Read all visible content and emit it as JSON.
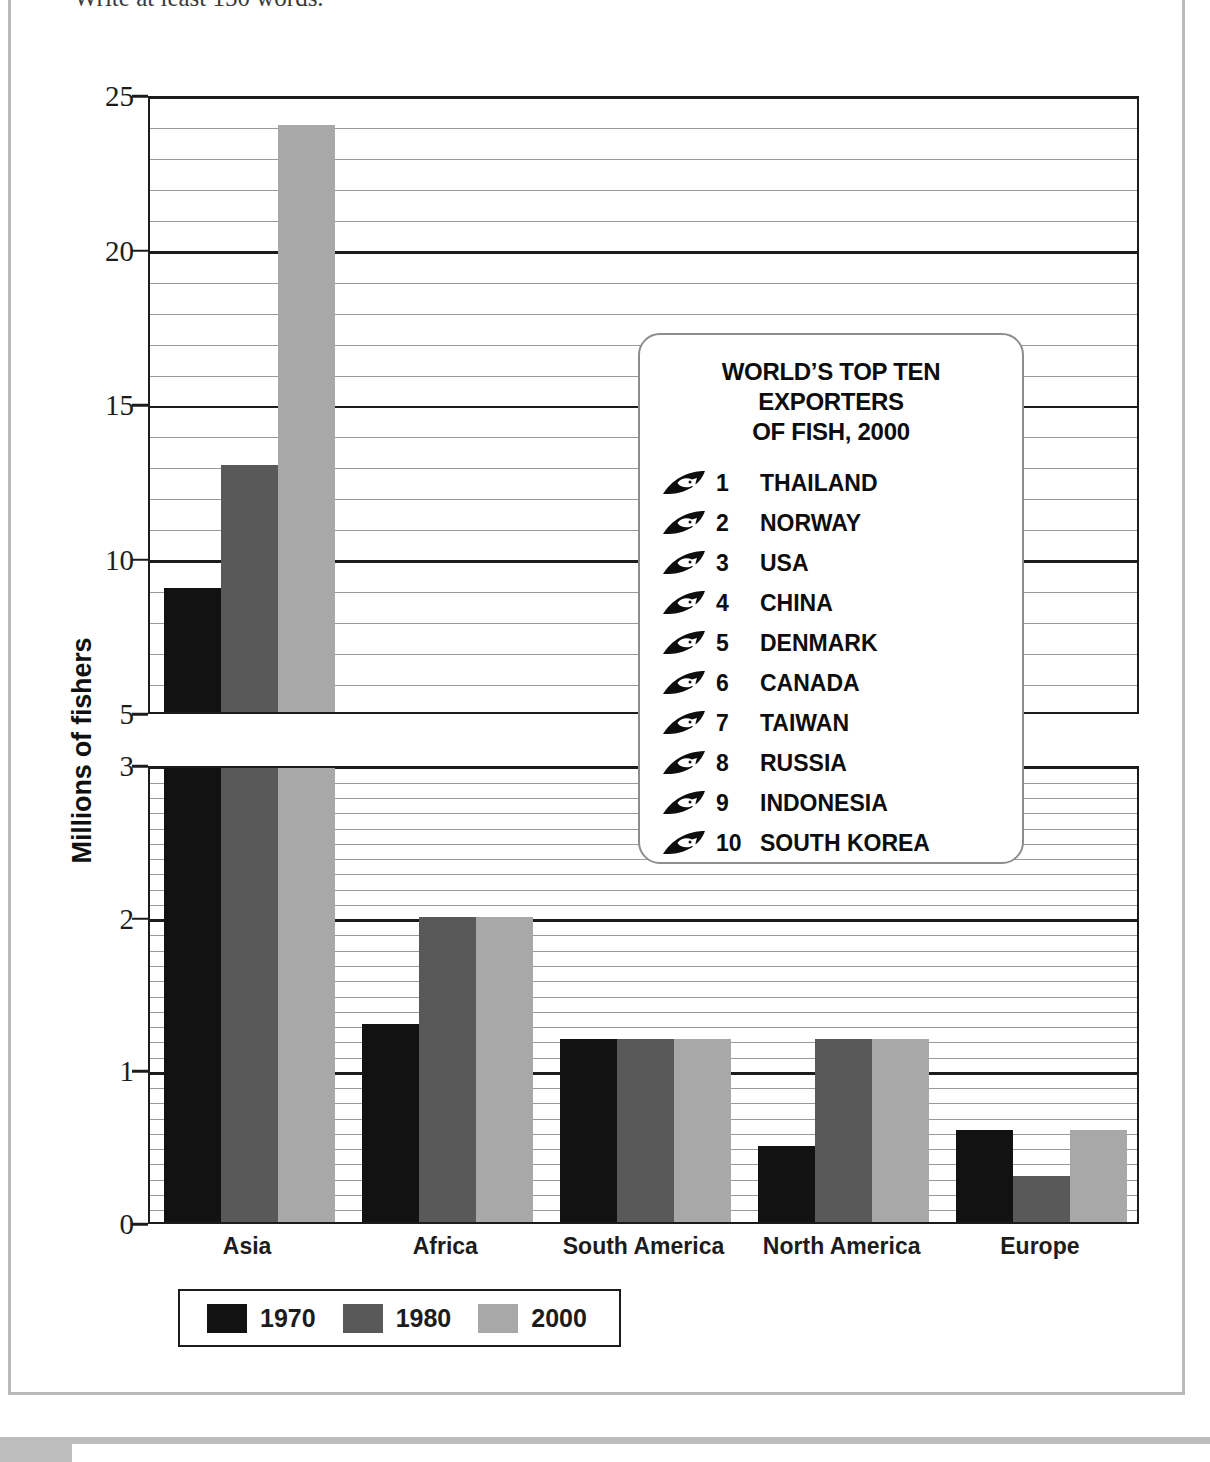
{
  "page": {
    "instruction_text": "Write at least 150 words."
  },
  "chart_data": {
    "type": "bar",
    "title": "",
    "xlabel": "",
    "ylabel": "Millions of fishers",
    "categories": [
      "Asia",
      "Africa",
      "South America",
      "North America",
      "Europe"
    ],
    "series": [
      {
        "name": "1970",
        "color": "#121212",
        "values": [
          9,
          1.3,
          1.2,
          0.5,
          0.6
        ]
      },
      {
        "name": "1980",
        "color": "#595959",
        "values": [
          13,
          2.0,
          1.2,
          1.2,
          0.3
        ]
      },
      {
        "name": "2000",
        "color": "#a8a8a8",
        "values": [
          24,
          2.0,
          1.2,
          1.2,
          0.6
        ]
      }
    ],
    "axis_break": true,
    "lower_axis": {
      "ylim": [
        0,
        3
      ],
      "major_ticks": [
        0,
        1,
        2,
        3
      ],
      "minor_tick_step": 0.1
    },
    "upper_axis": {
      "ylim": [
        5,
        25
      ],
      "major_ticks": [
        5,
        10,
        15,
        20,
        25
      ],
      "minor_tick_step": 1
    },
    "grid": true,
    "legend_position": "bottom-left",
    "legend_entries": [
      "1970",
      "1980",
      "2000"
    ]
  },
  "y_axis": {
    "title": "Millions of fishers",
    "upper_labels": [
      "25",
      "20",
      "15",
      "10",
      "5"
    ],
    "lower_labels": [
      "3",
      "2",
      "1",
      "0"
    ]
  },
  "legend": {
    "items": [
      {
        "label": "1970",
        "color": "#121212"
      },
      {
        "label": "1980",
        "color": "#595959"
      },
      {
        "label": "2000",
        "color": "#a8a8a8"
      }
    ]
  },
  "inset": {
    "title_line1": "WORLD’S TOP TEN EXPORTERS",
    "title_line2": "OF FISH, 2000",
    "items": [
      {
        "rank": "1",
        "country": "THAILAND"
      },
      {
        "rank": "2",
        "country": "NORWAY"
      },
      {
        "rank": "3",
        "country": "USA"
      },
      {
        "rank": "4",
        "country": "CHINA"
      },
      {
        "rank": "5",
        "country": "DENMARK"
      },
      {
        "rank": "6",
        "country": "CANADA"
      },
      {
        "rank": "7",
        "country": "TAIWAN"
      },
      {
        "rank": "8",
        "country": "RUSSIA"
      },
      {
        "rank": "9",
        "country": "INDONESIA"
      },
      {
        "rank": "10",
        "country": "SOUTH KOREA"
      }
    ]
  }
}
